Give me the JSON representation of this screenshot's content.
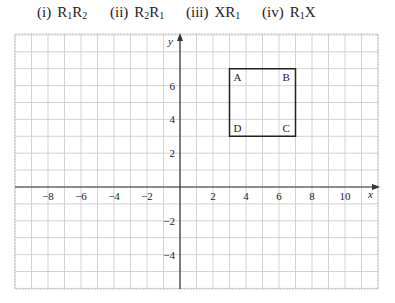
{
  "questions": [
    {
      "num": "(i)",
      "parts": [
        [
          "R",
          "1"
        ],
        [
          "R",
          "2"
        ]
      ],
      "left": 37
    },
    {
      "num": "(ii)",
      "parts": [
        [
          "R",
          "2"
        ],
        [
          "R",
          "1"
        ]
      ],
      "left": 110
    },
    {
      "num": "(iii)",
      "parts": [
        [
          "X",
          ""
        ],
        [
          "R",
          "1"
        ]
      ],
      "left": 186
    },
    {
      "num": "(iv)",
      "parts": [
        [
          "R",
          "1"
        ],
        [
          "X",
          ""
        ]
      ],
      "left": 262
    }
  ],
  "graph": {
    "x_axis_label": "x",
    "y_axis_label": "y",
    "x_range": [
      -10,
      12
    ],
    "y_range": [
      -6,
      9
    ],
    "x_ticks": [
      "-8",
      "-6",
      "-4",
      "-2",
      "2",
      "4",
      "6",
      "8",
      "10"
    ],
    "x_tick_values": [
      -8,
      -6,
      -4,
      -2,
      2,
      4,
      6,
      8,
      10
    ],
    "y_ticks": [
      "6",
      "4",
      "2",
      "-2",
      "-4"
    ],
    "y_tick_values": [
      6,
      4,
      2,
      -2,
      -4
    ],
    "grid_color": "#c8c8c8",
    "axis_color": "#333333",
    "square": {
      "vertices": [
        {
          "label": "A",
          "x": 3,
          "y": 7
        },
        {
          "label": "B",
          "x": 7,
          "y": 7
        },
        {
          "label": "C",
          "x": 7,
          "y": 3
        },
        {
          "label": "D",
          "x": 3,
          "y": 3
        }
      ],
      "color": "#222222"
    }
  }
}
